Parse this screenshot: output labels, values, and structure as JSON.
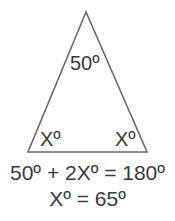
{
  "diagram": {
    "type": "isosceles-triangle",
    "stroke_color": "#6b6b6b",
    "text_color": "#3a3a3a",
    "apex_angle_label": "50º",
    "left_base_angle_label": "Xº",
    "right_base_angle_label": "Xº"
  },
  "equations": {
    "line1": "50º + 2Xº = 180º",
    "line2": "Xº = 65º"
  }
}
